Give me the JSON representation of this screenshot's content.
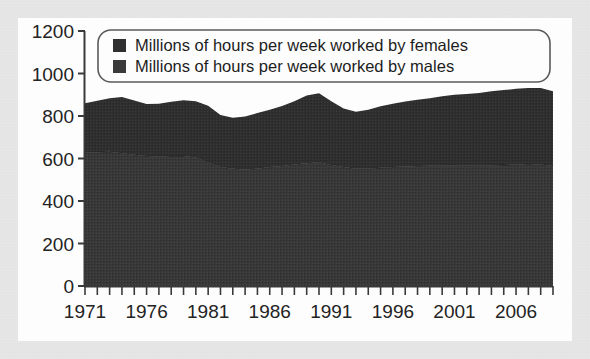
{
  "chart_data": {
    "type": "area",
    "stacked": true,
    "title": "",
    "xlabel": "",
    "ylabel": "",
    "ylim": [
      0,
      1200
    ],
    "xlim": [
      1971,
      2009
    ],
    "grid": false,
    "y_ticks": [
      "0",
      "200",
      "400",
      "600",
      "800",
      "1000",
      "1200"
    ],
    "y_tick_values": [
      0,
      200,
      400,
      600,
      800,
      1000,
      1200
    ],
    "x_ticks": [
      "1971",
      "1976",
      "1981",
      "1986",
      "1991",
      "1996",
      "2001",
      "2006"
    ],
    "x_tick_values": [
      1971,
      1976,
      1981,
      1986,
      1991,
      1996,
      2001,
      2006
    ],
    "x_minor_tick_interval": 1,
    "legend_position": "top-inside",
    "legend": [
      {
        "label": "Millions of hours per week worked by females",
        "color": "#2f2f2f",
        "swatch": "legend-swatch-females"
      },
      {
        "label": "Millions of hours per week worked by males",
        "color": "#3a3a3a",
        "swatch": "legend-swatch-males"
      }
    ],
    "x": [
      1971,
      1972,
      1973,
      1974,
      1975,
      1976,
      1977,
      1978,
      1979,
      1980,
      1981,
      1982,
      1983,
      1984,
      1985,
      1986,
      1987,
      1988,
      1989,
      1990,
      1991,
      1992,
      1993,
      1994,
      1995,
      1996,
      1997,
      1998,
      1999,
      2000,
      2001,
      2002,
      2003,
      2004,
      2005,
      2006,
      2007,
      2008,
      2009
    ],
    "series": [
      {
        "name": "Millions of hours per week worked by males",
        "color": "#3a3a3a",
        "values": [
          628,
          630,
          632,
          625,
          618,
          612,
          610,
          612,
          612,
          605,
          580,
          560,
          552,
          548,
          552,
          560,
          565,
          572,
          578,
          582,
          570,
          560,
          552,
          552,
          556,
          560,
          562,
          565,
          566,
          568,
          568,
          566,
          566,
          568,
          570,
          572,
          574,
          572,
          565
        ]
      },
      {
        "name": "Millions of hours per week worked by females",
        "color": "#2f2f2f",
        "values": [
          232,
          242,
          252,
          265,
          255,
          245,
          248,
          255,
          262,
          265,
          268,
          245,
          240,
          250,
          262,
          270,
          282,
          298,
          318,
          325,
          300,
          275,
          268,
          278,
          290,
          298,
          306,
          312,
          318,
          325,
          332,
          338,
          342,
          348,
          352,
          356,
          358,
          360,
          352
        ]
      }
    ],
    "totals": [
      860,
      872,
      884,
      890,
      873,
      857,
      858,
      867,
      874,
      870,
      848,
      805,
      792,
      798,
      814,
      830,
      847,
      870,
      896,
      907,
      870,
      835,
      820,
      830,
      846,
      858,
      868,
      877,
      884,
      893,
      900,
      904,
      908,
      916,
      922,
      928,
      932,
      932,
      917
    ]
  }
}
